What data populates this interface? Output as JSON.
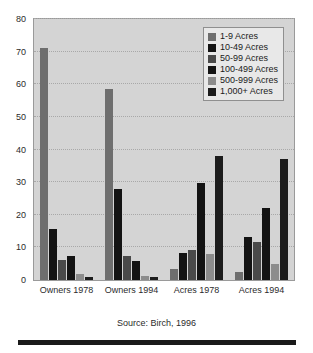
{
  "chart_data": {
    "type": "bar",
    "title": "",
    "subtitle": "",
    "xlabel": "",
    "ylabel": "",
    "ylim": [
      0,
      80
    ],
    "ytick_step": 10,
    "yticks": [
      0,
      10,
      20,
      30,
      40,
      50,
      60,
      70,
      80
    ],
    "grid": true,
    "grid_axis": "y",
    "legend_position": "top-right",
    "categories": [
      "Owners 1978",
      "Owners 1994",
      "Acres 1978",
      "Acres 1994"
    ],
    "series": [
      {
        "name": "1-9 Acres",
        "color": "#6e6e6e",
        "values": [
          71.0,
          58.5,
          3.5,
          2.5
        ]
      },
      {
        "name": "10-49 Acres",
        "color": "#131313",
        "values": [
          15.5,
          28.0,
          8.2,
          13.2
        ]
      },
      {
        "name": "50-99 Acres",
        "color": "#4a4a4a",
        "values": [
          6.2,
          7.3,
          9.1,
          11.7
        ]
      },
      {
        "name": "100-499 Acres",
        "color": "#131313",
        "values": [
          7.5,
          5.7,
          29.8,
          22.2
        ]
      },
      {
        "name": "500-999 Acres",
        "color": "#8c8c8c",
        "values": [
          1.7,
          1.2,
          7.9,
          4.8
        ]
      },
      {
        "name": "1,000+ Acres",
        "color": "#1c1c1c",
        "values": [
          1.0,
          0.9,
          38.0,
          37.2
        ]
      }
    ],
    "source_note": "Source: Birch, 1996"
  },
  "legend": {
    "items": [
      {
        "label": "1-9 Acres",
        "color": "#6e6e6e"
      },
      {
        "label": "10-49 Acres",
        "color": "#131313"
      },
      {
        "label": "50-99 Acres",
        "color": "#4a4a4a"
      },
      {
        "label": "100-499 Acres",
        "color": "#131313"
      },
      {
        "label": "500-999 Acres",
        "color": "#8c8c8c"
      },
      {
        "label": "1,000+ Acres",
        "color": "#1c1c1c"
      }
    ]
  },
  "axes": {
    "y_tick_labels": [
      "80",
      "70",
      "60",
      "50",
      "40",
      "30",
      "20",
      "10",
      "0"
    ],
    "x_tick_labels": [
      "Owners 1978",
      "Owners 1994",
      "Acres 1978",
      "Acres 1994"
    ]
  },
  "caption": {
    "source": "Source: Birch, 1996"
  },
  "colors": {
    "plot_background": "#d4d4d4",
    "page_background": "#ffffff",
    "gridline": "#a8a8a8",
    "axis_text": "#2b2b2b",
    "rule": "#1a1a1a"
  }
}
